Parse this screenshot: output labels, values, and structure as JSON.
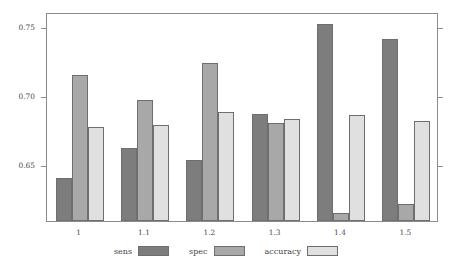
{
  "chart_data": {
    "type": "bar",
    "title": "",
    "subtitle": "",
    "xlabel": "",
    "ylabel": "",
    "categories": [
      "1",
      "1.1",
      "1.2",
      "1.3",
      "1.4",
      "1.5"
    ],
    "series": [
      {
        "name": "sens",
        "color": "#7d7d7d",
        "values": [
          0.64,
          0.662,
          0.653,
          0.687,
          0.752,
          0.741
        ]
      },
      {
        "name": "spec",
        "color": "#a8a8a8",
        "values": [
          0.715,
          0.697,
          0.724,
          0.68,
          0.615,
          0.621
        ]
      },
      {
        "name": "accuracy",
        "color": "#e0e0e0",
        "values": [
          0.677,
          0.679,
          0.688,
          0.683,
          0.686,
          0.682
        ]
      }
    ],
    "ylim": [
      0.6089,
      0.761
    ],
    "yticks": [
      0.65,
      0.7,
      0.75
    ],
    "ytick_labels": [
      "0.65",
      "0.70",
      "0.75"
    ],
    "grid": false,
    "legend_position": "bottom",
    "bar_border_color": "#6e6e6e",
    "axis_color": "#8c8c8c",
    "background": "#ffffff"
  },
  "legend": {
    "entries": [
      {
        "label": "sens",
        "color": "#7d7d7d"
      },
      {
        "label": "spec",
        "color": "#a8a8a8"
      },
      {
        "label": "accuracy",
        "color": "#e0e0e0"
      }
    ]
  },
  "axes": {
    "y": {
      "ticks": [
        {
          "label": "0.75",
          "value": 0.75
        },
        {
          "label": "0.70",
          "value": 0.7
        },
        {
          "label": "0.65",
          "value": 0.65
        }
      ]
    },
    "x": {
      "ticks": [
        {
          "label": "1"
        },
        {
          "label": "1.1"
        },
        {
          "label": "1.2"
        },
        {
          "label": "1.3"
        },
        {
          "label": "1.4"
        },
        {
          "label": "1.5"
        }
      ]
    }
  }
}
